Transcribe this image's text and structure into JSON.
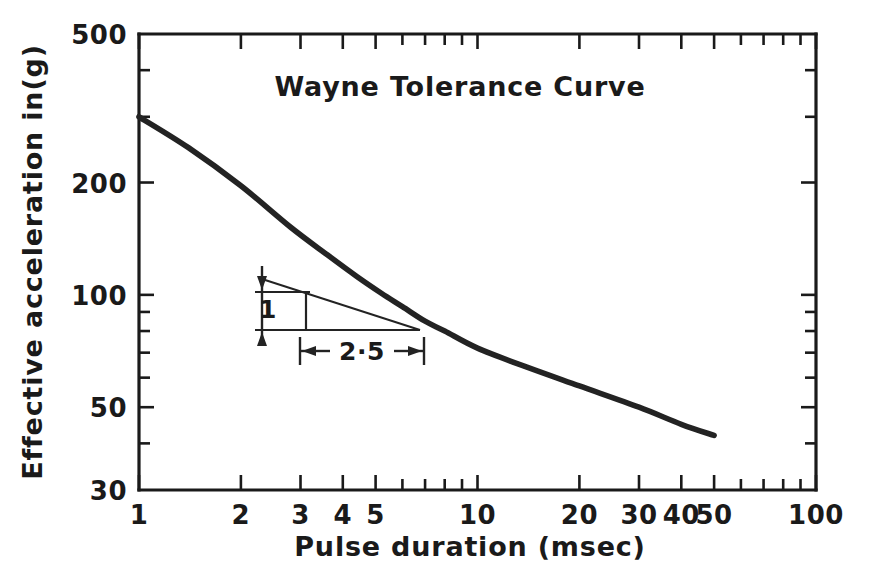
{
  "chart_data": {
    "type": "line",
    "title": "Wayne Tolerance Curve",
    "xlabel": "Pulse duration  (msec)",
    "ylabel": "Effective acceleration in(g)",
    "xscale": "log",
    "yscale": "log",
    "xlim": [
      1,
      100
    ],
    "ylim": [
      30,
      500
    ],
    "grid": false,
    "legend": null,
    "xticks": [
      {
        "value": 1,
        "label": "1"
      },
      {
        "value": 2,
        "label": "2"
      },
      {
        "value": 3,
        "label": "3"
      },
      {
        "value": 4,
        "label": "4"
      },
      {
        "value": 5,
        "label": "5"
      },
      {
        "value": 6,
        "label": ""
      },
      {
        "value": 7,
        "label": ""
      },
      {
        "value": 8,
        "label": ""
      },
      {
        "value": 9,
        "label": ""
      },
      {
        "value": 10,
        "label": "10"
      },
      {
        "value": 20,
        "label": "20"
      },
      {
        "value": 30,
        "label": "30"
      },
      {
        "value": 40,
        "label": "40"
      },
      {
        "value": 50,
        "label": "50"
      },
      {
        "value": 60,
        "label": ""
      },
      {
        "value": 70,
        "label": ""
      },
      {
        "value": 80,
        "label": ""
      },
      {
        "value": 90,
        "label": ""
      },
      {
        "value": 100,
        "label": "100"
      }
    ],
    "yticks": [
      {
        "value": 500,
        "label": "500"
      },
      {
        "value": 400,
        "label": ""
      },
      {
        "value": 300,
        "label": ""
      },
      {
        "value": 200,
        "label": "200"
      },
      {
        "value": 100,
        "label": "100"
      },
      {
        "value": 90,
        "label": ""
      },
      {
        "value": 80,
        "label": ""
      },
      {
        "value": 70,
        "label": ""
      },
      {
        "value": 60,
        "label": ""
      },
      {
        "value": 50,
        "label": "50"
      },
      {
        "value": 40,
        "label": ""
      },
      {
        "value": 30,
        "label": "30"
      }
    ],
    "series": [
      {
        "name": "Wayne Tolerance Curve",
        "x": [
          1.0,
          1.4,
          2.0,
          2.8,
          3.6,
          4.4,
          5.2,
          6.0,
          7.0,
          8.0,
          10.0,
          14.0,
          20.0,
          30.0,
          40.0,
          50.0
        ],
        "y": [
          300,
          248,
          196,
          152,
          128,
          112,
          101,
          93,
          85,
          80,
          72,
          64,
          57,
          50,
          45,
          42
        ]
      }
    ],
    "annotations": [
      {
        "name": "slope-triangle",
        "rise_label": "1",
        "run_label": "2·5",
        "meaning": "slope of -1 in 2.5 on log-log axes"
      }
    ]
  },
  "axis": {
    "y_title": "Effective acceleration in(g)",
    "x_title": "Pulse duration  (msec)"
  },
  "title": {
    "text": "Wayne Tolerance Curve"
  },
  "annotation": {
    "rise": "1",
    "run": "2·5"
  },
  "colors": {
    "ink": "#1a1a1a",
    "curve": "#232323",
    "background": "#ffffff"
  }
}
